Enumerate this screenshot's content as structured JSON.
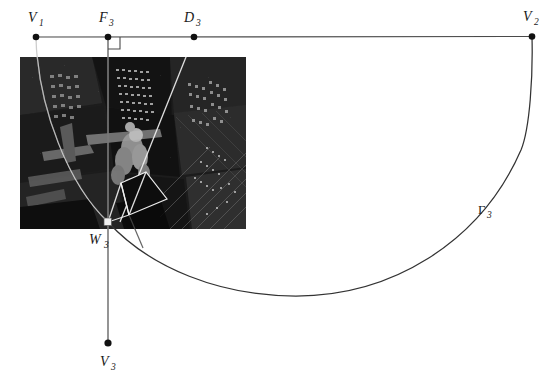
{
  "figure": {
    "type": "geometric-diagram",
    "background_color": "#ffffff",
    "line_color": "#4a4a4a",
    "curve_color": "#333333",
    "overlay_color": "#f2f2f2",
    "dot_color": "#111111",
    "caption": "",
    "points": [
      {
        "id": "V1",
        "letter": "V",
        "subscript": "1",
        "x": 36,
        "y": 37,
        "label_x": 30,
        "label_y": 20,
        "marker": "dot"
      },
      {
        "id": "F3",
        "letter": "F",
        "subscript": "3",
        "x": 108,
        "y": 37,
        "label_x": 100,
        "label_y": 20,
        "marker": "dot"
      },
      {
        "id": "D3",
        "letter": "D",
        "subscript": "3",
        "x": 194,
        "y": 37,
        "label_x": 187,
        "label_y": 20,
        "marker": "dot"
      },
      {
        "id": "V2",
        "letter": "V",
        "subscript": "2",
        "x": 532,
        "y": 36,
        "label_x": 524,
        "label_y": 19,
        "marker": "dot"
      },
      {
        "id": "W3",
        "letter": "W",
        "subscript": "3",
        "x": 108,
        "y": 222,
        "label_x": 92,
        "label_y": 244,
        "marker": "square"
      },
      {
        "id": "V3",
        "letter": "V",
        "subscript": "3",
        "x": 108,
        "y": 343,
        "label_x": 101,
        "label_y": 365,
        "marker": "dot"
      }
    ],
    "curve_label": {
      "letter": "Γ",
      "subscript": "3",
      "x": 481,
      "y": 214
    },
    "photo": {
      "name": "aerial-city-night-photo",
      "x": 20,
      "y": 57,
      "width": 226,
      "height": 172,
      "description": "black and white aerial night view of city skyscrapers with a figure"
    },
    "segments": [
      {
        "name": "baseline-V1-V2",
        "from": "V1",
        "to": "V2"
      },
      {
        "name": "vertical-F3-V3",
        "from": "F3",
        "to": "V3"
      }
    ],
    "right_angle_marker": {
      "x": 108,
      "y": 37,
      "size": 12
    }
  }
}
